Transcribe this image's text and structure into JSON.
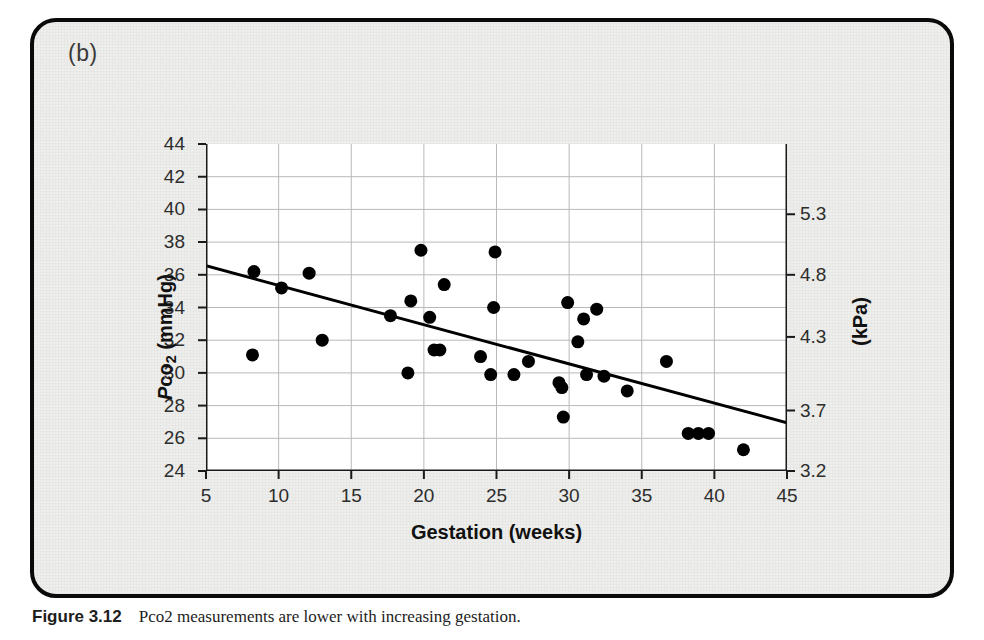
{
  "figure": {
    "panel_label": "(b)",
    "caption": "Figure 3.12    Pco2 measurements are lower with increasing gestation."
  },
  "chart_data": {
    "type": "scatter",
    "title": "",
    "xlabel": "Gestation (weeks)",
    "ylabel": "Pco2 (mmHg)",
    "ylabel_right": "(kPa)",
    "xlim": [
      5,
      45
    ],
    "ylim": [
      24,
      44
    ],
    "grid": true,
    "legend": "none",
    "xticks": [
      5,
      10,
      15,
      20,
      25,
      30,
      35,
      40,
      45
    ],
    "xtick_labels": [
      "5",
      "10",
      "15",
      "20",
      "25",
      "30",
      "35",
      "40",
      "45"
    ],
    "yticks": [
      24,
      26,
      28,
      30,
      32,
      34,
      36,
      38,
      40,
      42,
      44
    ],
    "ytick_labels": [
      "24",
      "26",
      "28",
      "30",
      "32",
      "34",
      "36",
      "38",
      "40",
      "42",
      "44"
    ],
    "yticks_right_mmHg": [
      24.0,
      27.7,
      32.2,
      36.0,
      39.7
    ],
    "ytick_labels_right": [
      "3.2",
      "3.7",
      "4.3",
      "4.8",
      "5.3"
    ],
    "marker": "filled-circle",
    "marker_color": "#000000",
    "marker_size_px": 13,
    "points": [
      {
        "x": 8.2,
        "y": 31.1
      },
      {
        "x": 8.3,
        "y": 36.2
      },
      {
        "x": 10.2,
        "y": 35.2
      },
      {
        "x": 12.1,
        "y": 36.1
      },
      {
        "x": 13.0,
        "y": 32.0
      },
      {
        "x": 17.7,
        "y": 33.5
      },
      {
        "x": 18.9,
        "y": 30.0
      },
      {
        "x": 19.1,
        "y": 34.4
      },
      {
        "x": 19.8,
        "y": 37.5
      },
      {
        "x": 20.4,
        "y": 33.4
      },
      {
        "x": 20.7,
        "y": 31.4
      },
      {
        "x": 21.1,
        "y": 31.4
      },
      {
        "x": 21.4,
        "y": 35.4
      },
      {
        "x": 23.9,
        "y": 31.0
      },
      {
        "x": 24.6,
        "y": 29.9
      },
      {
        "x": 24.8,
        "y": 34.0
      },
      {
        "x": 24.9,
        "y": 37.4
      },
      {
        "x": 26.2,
        "y": 29.9
      },
      {
        "x": 27.2,
        "y": 30.7
      },
      {
        "x": 29.3,
        "y": 29.4
      },
      {
        "x": 29.5,
        "y": 29.1
      },
      {
        "x": 29.6,
        "y": 27.3
      },
      {
        "x": 29.9,
        "y": 34.3
      },
      {
        "x": 30.6,
        "y": 31.9
      },
      {
        "x": 31.0,
        "y": 33.3
      },
      {
        "x": 31.2,
        "y": 29.9
      },
      {
        "x": 31.9,
        "y": 33.9
      },
      {
        "x": 32.4,
        "y": 29.8
      },
      {
        "x": 34.0,
        "y": 28.9
      },
      {
        "x": 36.7,
        "y": 30.7
      },
      {
        "x": 38.2,
        "y": 26.3
      },
      {
        "x": 38.9,
        "y": 26.3
      },
      {
        "x": 39.6,
        "y": 26.3
      },
      {
        "x": 42.0,
        "y": 25.3
      }
    ],
    "trend_line": {
      "type": "linear-regression",
      "x_start": 5,
      "y_start": 36.55,
      "x_end": 45,
      "y_end": 26.95,
      "color": "#000000",
      "width_px": 3
    }
  }
}
